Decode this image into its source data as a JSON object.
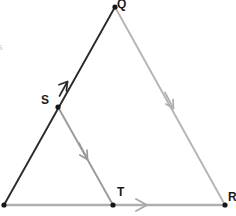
{
  "figure": {
    "type": "geometry-diagram",
    "background_color": "#ffffff",
    "width": 236,
    "height": 216
  },
  "colors": {
    "dark_line": "#2b2b2b",
    "light_line": "#b5b5b5",
    "mid_line": "#9a9a9a",
    "bottom_line": "#b0b0b0",
    "vertex_dot": "#161616",
    "label_text": "#1a1a1a",
    "edge_mark": "#c9c9c9"
  },
  "vertices": [
    {
      "name": "P",
      "label": "",
      "x": 4,
      "y": 205,
      "dot": true
    },
    {
      "name": "Q",
      "label": "Q",
      "x": 115,
      "y": 7,
      "dot": true
    },
    {
      "name": "R",
      "label": "R",
      "x": 225,
      "y": 205,
      "dot": true
    },
    {
      "name": "S",
      "label": "S",
      "x": 58,
      "y": 107,
      "dot": true
    },
    {
      "name": "T",
      "label": "T",
      "x": 113,
      "y": 205,
      "dot": true
    }
  ],
  "segments": [
    {
      "name": "PQ",
      "from": "P",
      "to": "Q",
      "color": "#2b2b2b",
      "width": 1.8,
      "arrow": "up-single"
    },
    {
      "name": "QR",
      "from": "Q",
      "to": "R",
      "color": "#b5b5b5",
      "width": 1.8,
      "arrow": "down-single"
    },
    {
      "name": "PR",
      "from": "P",
      "to": "R",
      "color": "#b0b0b0",
      "width": 2.2,
      "arrow": "right-single"
    },
    {
      "name": "ST",
      "from": "S",
      "to": "T",
      "color": "#9a9a9a",
      "width": 1.8,
      "arrow": "down-single"
    }
  ],
  "labels": {
    "q": "Q",
    "s": "S",
    "t": "T",
    "r": "R",
    "edge_mark": "s"
  },
  "arrow_marks": [
    {
      "name": "arrow-pq",
      "on": "PQ",
      "x": 62,
      "y": 95,
      "direction": "toward-Q"
    },
    {
      "name": "arrow-qr",
      "on": "QR",
      "x": 172,
      "y": 104,
      "direction": "toward-R"
    },
    {
      "name": "arrow-st",
      "on": "ST",
      "x": 86,
      "y": 155,
      "direction": "toward-T"
    },
    {
      "name": "arrow-pr",
      "on": "PR",
      "x": 142,
      "y": 205,
      "direction": "toward-R"
    }
  ]
}
